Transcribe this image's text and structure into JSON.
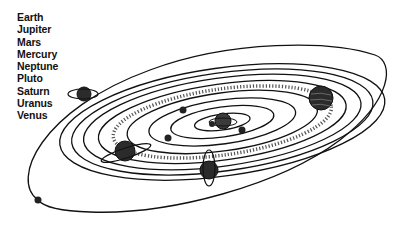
{
  "diagram": {
    "type": "solar-system-illustration",
    "labels": [
      "Earth",
      "Jupiter",
      "Mars",
      "Mercury",
      "Neptune",
      "Pluto",
      "Saturn",
      "Uranus",
      "Venus"
    ],
    "colors": {
      "line": "#111111",
      "planet_fill": "#2b2b2b",
      "background": "#ffffff"
    }
  }
}
